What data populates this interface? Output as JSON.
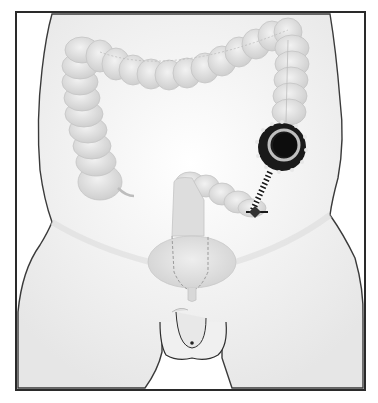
{
  "figure": {
    "colors": {
      "background": "#ffffff",
      "frame": "#2a2a2a",
      "body_fill": "#f4f4f4",
      "body_outline": "#3a3a3a",
      "colon_fill": "#e2e2e2",
      "colon_shade": "#cfcfcf",
      "scope": "#1a1a1a"
    },
    "parts": [
      {
        "name": "ascending-colon"
      },
      {
        "name": "transverse-colon"
      },
      {
        "name": "descending-colon"
      },
      {
        "name": "sigmoid-colon"
      },
      {
        "name": "rectum"
      },
      {
        "name": "bladder"
      },
      {
        "name": "colonoscope"
      },
      {
        "name": "colonoscope-tip"
      },
      {
        "name": "genitals"
      }
    ]
  }
}
